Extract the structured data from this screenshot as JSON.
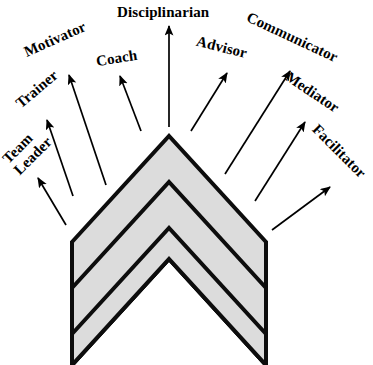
{
  "figure": {
    "title": "Disciplinarian",
    "shape_name": "three-band-chevron",
    "colors": {
      "chevron_fill": "#dcdcdc",
      "chevron_stroke": "#0d0d0d",
      "arrow": "#000000",
      "background": "#ffffff",
      "text": "#000000"
    }
  },
  "labels": [
    {
      "id": "team-leader",
      "text": "Team\nLeader",
      "lines": [
        "Team",
        "Leader"
      ],
      "rotation_deg": -45,
      "font_size": 15,
      "left": 4,
      "top": 134,
      "two_line": true
    },
    {
      "id": "trainer",
      "text": "Trainer",
      "rotation_deg": -40,
      "font_size": 15,
      "left": 12,
      "top": 81,
      "two_line": false
    },
    {
      "id": "motivator",
      "text": "Motivator",
      "rotation_deg": -24,
      "font_size": 15,
      "left": 22,
      "top": 31,
      "two_line": false
    },
    {
      "id": "coach",
      "text": "Coach",
      "rotation_deg": -9,
      "font_size": 15,
      "left": 96,
      "top": 50,
      "two_line": false
    },
    {
      "id": "disciplinarian",
      "text": "Disciplinarian",
      "rotation_deg": 0,
      "font_size": 15,
      "left": 117,
      "top": 4,
      "two_line": false
    },
    {
      "id": "advisor",
      "text": "Advisor",
      "rotation_deg": 14,
      "font_size": 15,
      "left": 196,
      "top": 39,
      "two_line": false
    },
    {
      "id": "communicator",
      "text": "Communicator",
      "rotation_deg": 25,
      "font_size": 15,
      "left": 243,
      "top": 29,
      "two_line": false
    },
    {
      "id": "mediator",
      "text": "Mediator",
      "rotation_deg": 34,
      "font_size": 15,
      "left": 282,
      "top": 84,
      "two_line": false
    },
    {
      "id": "facilitator",
      "text": "Facilitator",
      "rotation_deg": 45,
      "font_size": 15,
      "left": 305,
      "top": 143,
      "two_line": false
    }
  ],
  "arrows": [
    {
      "id": "arrow-team-leader",
      "for": "team-leader",
      "x1": 66,
      "y1": 225,
      "x2": 38,
      "y2": 178
    },
    {
      "id": "arrow-trainer",
      "for": "trainer",
      "x1": 73,
      "y1": 196,
      "x2": 47,
      "y2": 120
    },
    {
      "id": "arrow-motivator",
      "for": "motivator",
      "x1": 106,
      "y1": 185,
      "x2": 69,
      "y2": 75
    },
    {
      "id": "arrow-coach",
      "for": "coach",
      "x1": 141,
      "y1": 131,
      "x2": 120,
      "y2": 76
    },
    {
      "id": "arrow-disciplinarian",
      "for": "disciplinarian",
      "x1": 169,
      "y1": 127,
      "x2": 169,
      "y2": 26
    },
    {
      "id": "arrow-advisor",
      "for": "advisor",
      "x1": 191,
      "y1": 131,
      "x2": 227,
      "y2": 73
    },
    {
      "id": "arrow-communicator",
      "for": "communicator",
      "x1": 225,
      "y1": 174,
      "x2": 290,
      "y2": 71
    },
    {
      "id": "arrow-mediator",
      "for": "mediator",
      "x1": 255,
      "y1": 201,
      "x2": 305,
      "y2": 122
    },
    {
      "id": "arrow-facilitator",
      "for": "facilitator",
      "x1": 272,
      "y1": 230,
      "x2": 330,
      "y2": 187
    }
  ],
  "chevron_bands": [
    {
      "id": "chevron-band-outer",
      "points": "72,242 169,136 266,242 266,365 169,259 72,365"
    },
    {
      "id": "chevron-band-middle",
      "points": "72,288 169,182 266,288 266,365 169,259 72,365"
    },
    {
      "id": "chevron-band-inner",
      "points": "72,334 169,228 266,334 266,365 169,259 72,365"
    }
  ]
}
